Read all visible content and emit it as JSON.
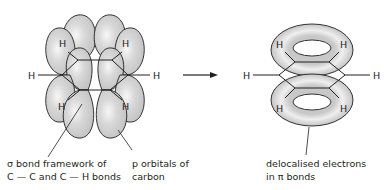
{
  "diagram": {
    "left": {
      "atoms": [
        "H",
        "H",
        "H",
        "H",
        "H",
        "H"
      ],
      "label_sigma_line1": "σ bond framework of",
      "label_sigma_line2": "C — C and C — H bonds",
      "label_p_line1": "p orbitals of",
      "label_p_line2": "carbon"
    },
    "arrow": "reaction-arrow",
    "right": {
      "atoms": [
        "H",
        "H",
        "H",
        "H",
        "H",
        "H"
      ],
      "label_deloc_line1": "delocalised electrons",
      "label_deloc_line2": "in π bonds"
    },
    "colors": {
      "lobe_fill": "#c8c8c8",
      "lobe_highlight": "#f2f2f2",
      "outline": "#231f20",
      "background": "#ffffff"
    }
  }
}
